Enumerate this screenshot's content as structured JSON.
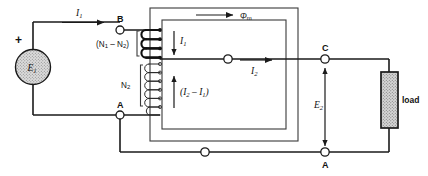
{
  "diagram": {
    "type": "electrical-schematic",
    "background_color": "#ffffff",
    "line_color": "#1a1a1a",
    "source": {
      "name": "voltage-source",
      "symbol": "circle",
      "label": "E",
      "label_sub": "1",
      "polarity_marker": "+",
      "fill_color": "#d9d9d9"
    },
    "labels": {
      "current_primary": "I",
      "current_primary_sub": "1",
      "current_winding_top": "I",
      "current_winding_top_sub": "1",
      "current_secondary": "I",
      "current_secondary_sub": "2",
      "current_common_open": "(I",
      "current_common_sub1": "2",
      "current_common_mid": " – I",
      "current_common_sub2": "1",
      "current_common_close": ")",
      "flux": "Φ",
      "flux_sub": "m",
      "turns_series_open": "(N",
      "turns_series_sub1": "1",
      "turns_series_mid": " – N",
      "turns_series_sub2": "2",
      "turns_series_close": ")",
      "turns_common": "N",
      "turns_common_sub": "2",
      "emf_secondary": "E",
      "emf_secondary_sub": "2",
      "load": "load"
    },
    "terminals": [
      {
        "name": "terminal-b",
        "label": "B",
        "x": 120,
        "y": 30
      },
      {
        "name": "terminal-a-left",
        "label": "A",
        "x": 120,
        "y": 115
      },
      {
        "name": "terminal-c",
        "label": "C",
        "x": 325,
        "y": 59
      },
      {
        "name": "terminal-a-bottom",
        "label": "A",
        "x": 325,
        "y": 152
      },
      {
        "name": "terminal-mid-bottom",
        "label": "",
        "x": 205,
        "y": 152
      },
      {
        "name": "terminal-mid-secondary",
        "label": "",
        "x": 228,
        "y": 59
      }
    ],
    "load_element": {
      "name": "load-resistor",
      "label": "load",
      "fill_pattern": "stipple",
      "fill_color": "#c8c8c8"
    }
  }
}
